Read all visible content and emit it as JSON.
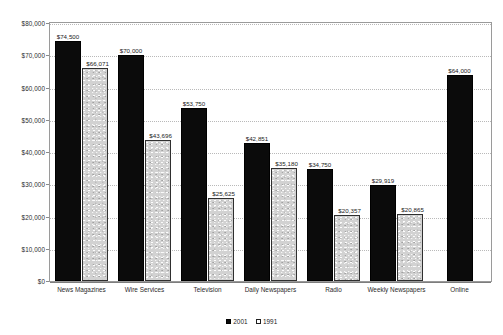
{
  "chart_data": {
    "type": "bar",
    "title": "",
    "subtitle": "",
    "xlabel": "",
    "ylabel": "",
    "ylim": [
      0,
      80000
    ],
    "grid": true,
    "legend_position": "bottom-center",
    "y_ticks": [
      "$0",
      "$10,000",
      "$20,000",
      "$30,000",
      "$40,000",
      "$50,000",
      "$60,000",
      "$70,000",
      "$80,000"
    ],
    "y_tick_values": [
      0,
      10000,
      20000,
      30000,
      40000,
      50000,
      60000,
      70000,
      80000
    ],
    "categories": [
      "News Magazines",
      "Wire Services",
      "Television",
      "Daily Newspapers",
      "Radio",
      "Weekly Newspapers",
      "Online"
    ],
    "series": [
      {
        "name": "2001",
        "color": "#0b0b0b",
        "values": [
          74500,
          70000,
          53750,
          42851,
          34750,
          29919,
          64000
        ],
        "labels": [
          "$74,500",
          "$70,000",
          "$53,750",
          "$42,851",
          "$34,750",
          "$29,919",
          "$64,000"
        ]
      },
      {
        "name": "1991",
        "color": "#d2d2d2",
        "values": [
          66071,
          43696,
          25625,
          35180,
          20357,
          20865,
          null
        ],
        "labels": [
          "$66,071",
          "$43,696",
          "$25,625",
          "$35,180",
          "$20,357",
          "$20,865",
          ""
        ]
      }
    ],
    "legend": [
      {
        "label": "2001",
        "swatch": "filled-black-square"
      },
      {
        "label": "1991",
        "swatch": "open-white-square"
      }
    ]
  }
}
